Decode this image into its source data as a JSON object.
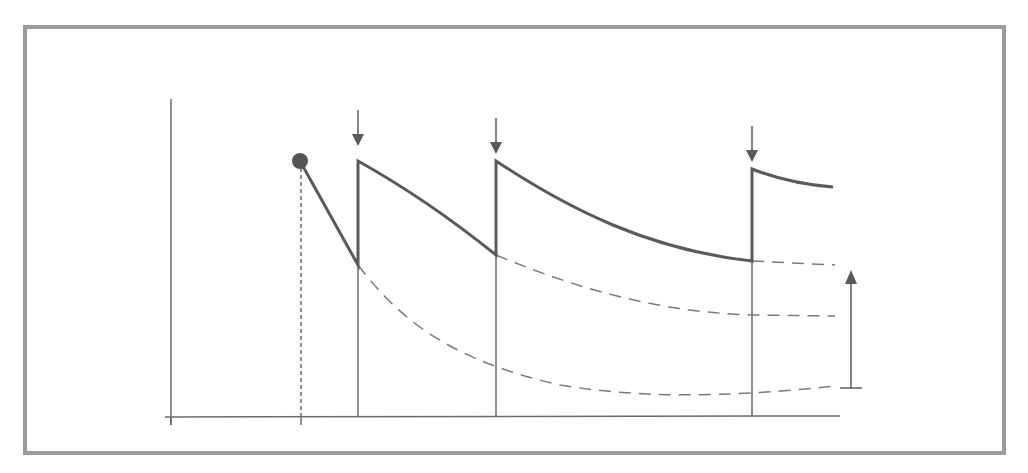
{
  "diagram": {
    "type": "repeated-dose concentration-time curve",
    "colors": {
      "background": "#ffffff",
      "frame": "#9a9a9a",
      "curve": "#5a5a5a",
      "axis": "#6a6a6a",
      "dashed": "#7a7a7a",
      "dot": "#555555"
    },
    "frame": {
      "x": 25,
      "y": 27,
      "width": 979,
      "height": 426,
      "stroke_width": 4
    },
    "axes": {
      "y_axis": {
        "x": 171,
        "y1": 99,
        "y2": 425
      },
      "x_axis": {
        "y": 417,
        "x1": 165,
        "x2": 840
      },
      "ticks": [
        {
          "x": 171
        },
        {
          "x": 301
        }
      ]
    },
    "initial_dose_marker": {
      "cx": 300,
      "cy": 161,
      "r": 8,
      "dotted_drop_x": 301
    },
    "doses": [
      {
        "label_icon": "down-arrow-icon",
        "x": 358,
        "arrow_top": 110,
        "arrow_tip": 146,
        "peak_y": 161,
        "trough_y_before": 265
      },
      {
        "label_icon": "down-arrow-icon",
        "x": 496,
        "arrow_top": 118,
        "arrow_tip": 154,
        "peak_y": 161,
        "trough_y_before": 255
      },
      {
        "label_icon": "down-arrow-icon",
        "x": 752,
        "arrow_top": 126,
        "arrow_tip": 162,
        "peak_y": 169,
        "trough_y_before": 261
      }
    ],
    "solid_curve_path": "M300,161 L358,265 L358,161 C410,190 455,222 496,255 L496,161 C570,210 650,250 752,261 L752,169 C780,180 805,185 833,187",
    "dashed_curves": [
      {
        "name": "decay-after-dose-1",
        "path": "M358,265 C400,320 450,360 560,385 C640,398 720,398 835,386"
      },
      {
        "name": "decay-after-dose-2",
        "path": "M496,255 C580,290 660,312 752,315 L835,316"
      },
      {
        "name": "decay-after-dose-3",
        "path": "M752,261 L835,265"
      }
    ],
    "accumulation_arrow": {
      "x": 851,
      "y_base": 388,
      "y_tip": 270,
      "base_x1": 840,
      "base_x2": 862,
      "icon": "up-arrow-icon"
    },
    "text_labels": []
  }
}
